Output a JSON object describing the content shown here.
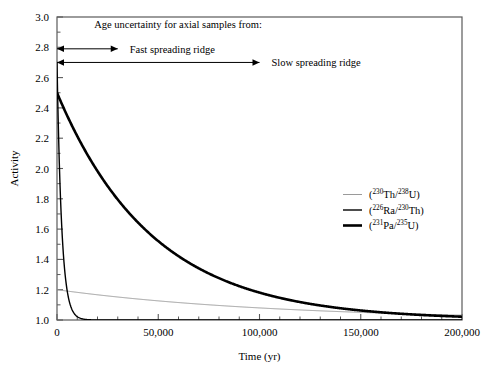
{
  "chart_data": {
    "type": "line",
    "title": "",
    "xlabel": "Time (yr)",
    "ylabel": "Activity",
    "xlim": [
      0,
      200000
    ],
    "ylim": [
      1.0,
      3.0
    ],
    "xticks": [
      0,
      50000,
      100000,
      150000,
      200000
    ],
    "xticklabels": [
      "0",
      "50,000",
      "100,000",
      "150,000",
      "200,000"
    ],
    "xminor_step": 10000,
    "yticks": [
      1.0,
      1.2,
      1.4,
      1.6,
      1.8,
      2.0,
      2.2,
      2.4,
      2.6,
      2.8,
      3.0
    ],
    "yticklabels": [
      "1.0",
      "1.2",
      "1.4",
      "1.6",
      "1.8",
      "2.0",
      "2.2",
      "2.4",
      "2.6",
      "2.8",
      "3.0"
    ],
    "grid": false,
    "legend_position": "center-right",
    "series": [
      {
        "name": "(230Th/238U)",
        "label_plain": "(230Th/238U)",
        "initial_activity": 1.2,
        "half_life_yr": 75380,
        "color": "#9a9a9a",
        "line_width": 1.0,
        "x": [
          0,
          10000,
          20000,
          30000,
          40000,
          50000,
          60000,
          70000,
          80000,
          90000,
          100000,
          110000,
          120000,
          130000,
          140000,
          150000,
          160000,
          170000,
          180000,
          190000,
          200000
        ],
        "y": [
          1.2,
          1.183,
          1.167,
          1.153,
          1.139,
          1.127,
          1.116,
          1.105,
          1.096,
          1.087,
          1.079,
          1.071,
          1.065,
          1.058,
          1.053,
          1.048,
          1.043,
          1.039,
          1.035,
          1.032,
          1.029
        ]
      },
      {
        "name": "(226Ra/230Th)",
        "label_plain": "(226Ra/230Th)",
        "initial_activity": 2.7,
        "half_life_yr": 1600,
        "color": "#000000",
        "line_width": 1.4,
        "x": [
          0,
          1000,
          2000,
          3000,
          4000,
          5000,
          6000,
          7000,
          8000,
          9000,
          10000,
          12000,
          14000,
          16000,
          20000,
          30000,
          50000,
          100000,
          150000,
          200000
        ],
        "y": [
          2.7,
          2.155,
          1.796,
          1.559,
          1.403,
          1.301,
          1.233,
          1.189,
          1.16,
          1.14,
          1.128,
          1.113,
          1.105,
          1.101,
          1.1,
          1.1,
          1.1,
          1.1,
          1.1,
          1.1
        ]
      },
      {
        "name": "(231Pa/235U)",
        "label_plain": "(231Pa/235U)",
        "initial_activity": 2.5,
        "half_life_yr": 32760,
        "color": "#000000",
        "line_width": 2.6,
        "x": [
          0,
          10000,
          20000,
          30000,
          40000,
          50000,
          60000,
          70000,
          80000,
          90000,
          100000,
          110000,
          120000,
          130000,
          140000,
          150000,
          160000,
          170000,
          180000,
          190000,
          200000
        ],
        "y": [
          2.5,
          2.155,
          1.885,
          1.673,
          1.507,
          1.377,
          1.275,
          1.195,
          1.133,
          1.084,
          1.046,
          1.016,
          0.993,
          0.975,
          0.961,
          0.95,
          0.941,
          0.935,
          0.929,
          0.925,
          0.922
        ]
      }
    ],
    "annotations": {
      "header": "Age uncertainty for axial samples from:",
      "fast_ridge_label": "Fast spreading ridge",
      "slow_ridge_label": "Slow spreading ridge",
      "fast_ridge_range_yr": [
        0,
        30000
      ],
      "slow_ridge_range_yr": [
        0,
        100000
      ],
      "fast_ridge_arrow_y": 2.79,
      "slow_ridge_arrow_y": 2.7
    },
    "legend_entries": [
      {
        "numerator_mass": "230",
        "numerator_el": "Th",
        "denominator_mass": "238",
        "denominator_el": "U"
      },
      {
        "numerator_mass": "226",
        "numerator_el": "Ra",
        "denominator_mass": "230",
        "denominator_el": "Th"
      },
      {
        "numerator_mass": "231",
        "numerator_el": "Pa",
        "denominator_mass": "235",
        "denominator_el": "U"
      }
    ]
  },
  "axis": {
    "ylabel": "Activity",
    "xlabel": "Time (yr)"
  },
  "colors": {
    "frame": "#5a5a5a",
    "thin_curve": "#9a9a9a",
    "thick_curve": "#000000",
    "background": "#ffffff"
  }
}
